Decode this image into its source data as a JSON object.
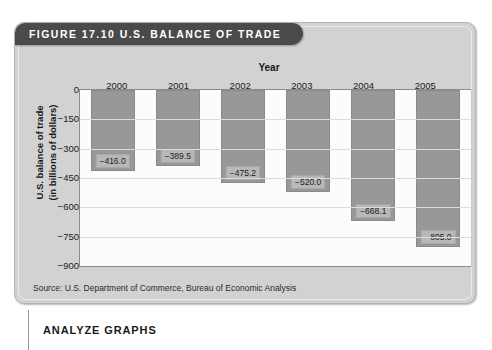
{
  "figure": {
    "title": "FIGURE 17.10   U.S. BALANCE OF TRADE",
    "source": "Source: U.S. Department of Commerce, Bureau of Economic Analysis",
    "caption": "ANALYZE GRAPHS"
  },
  "colors": {
    "title_bar": "#4a4a4a",
    "card": "#d2d2d2",
    "bar_fill": "#989898",
    "plot_background": "#fcfcfc",
    "gridline": "#dcdcdc",
    "text": "#1a1a1a"
  },
  "chart_data": {
    "type": "bar",
    "title": "FIGURE 17.10   U.S. BALANCE OF TRADE",
    "xlabel": "Year",
    "ylabel": "U.S. balance of trade (in billions of dollars)",
    "ylabel_lines": [
      "U.S. balance of trade",
      "(in billions of dollars)"
    ],
    "categories": [
      "2000",
      "2001",
      "2002",
      "2003",
      "2004",
      "2005"
    ],
    "values": [
      -416.0,
      -389.5,
      -475.2,
      -520.0,
      -668.1,
      -805.0
    ],
    "value_labels": [
      "−416.0",
      "−389.5",
      "−475.2",
      "−520.0",
      "−668.1",
      "−805.0"
    ],
    "yticks": [
      0,
      -150,
      -300,
      -450,
      -600,
      -750,
      -900
    ],
    "ytick_labels": [
      "0",
      "−150",
      "−300",
      "−450",
      "−600",
      "−750",
      "−900"
    ],
    "ylim": [
      -900,
      0
    ],
    "grid": true,
    "legend": false
  }
}
